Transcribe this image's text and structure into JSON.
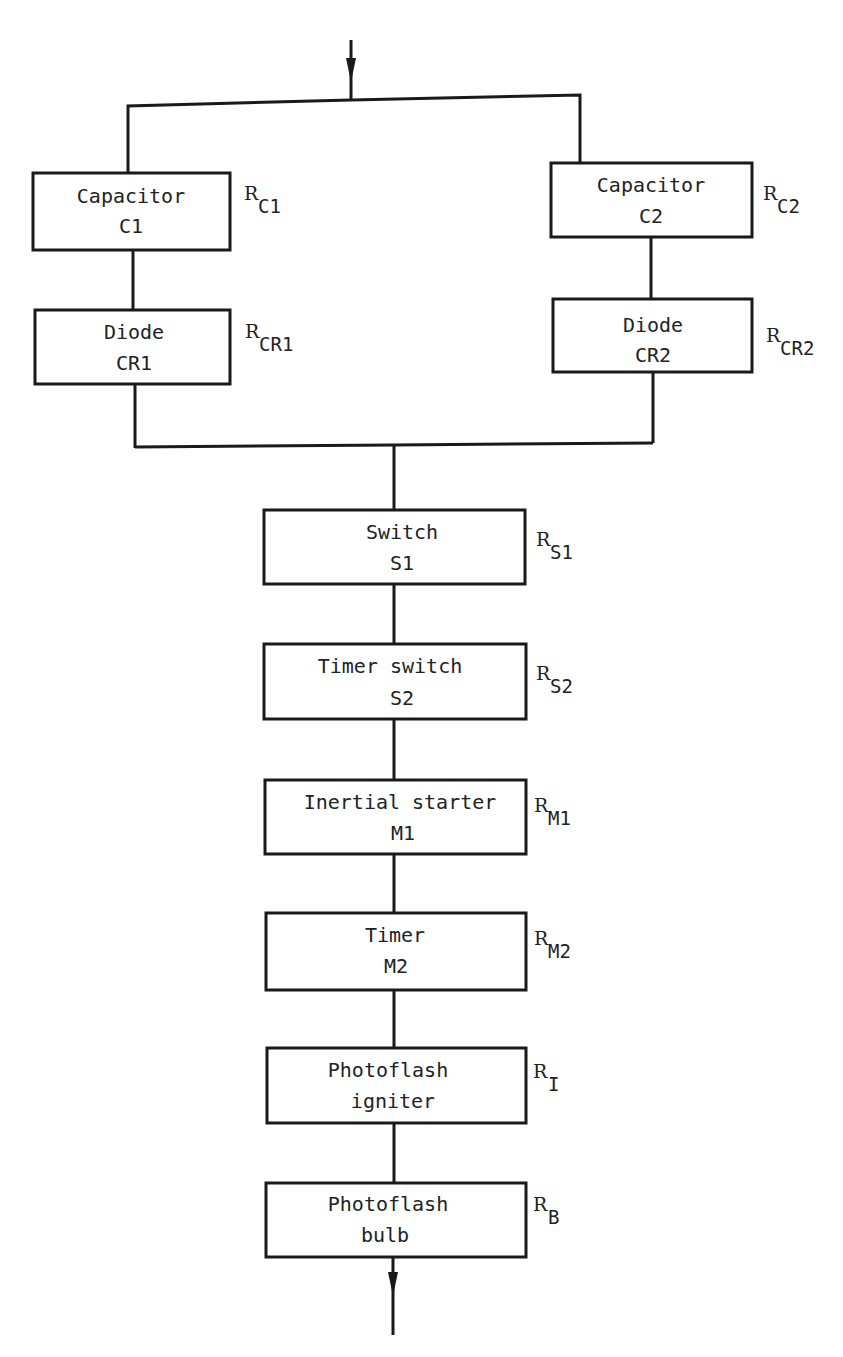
{
  "diagram": {
    "type": "reliability block diagram",
    "parallel_branches": [
      {
        "blocks": [
          {
            "line1": "Capacitor",
            "line2": "C1",
            "rel_base": "R",
            "rel_sub": "C1"
          },
          {
            "line1": "Diode",
            "line2": "CR1",
            "rel_base": "R",
            "rel_sub": "CR1"
          }
        ]
      },
      {
        "blocks": [
          {
            "line1": "Capacitor",
            "line2": "C2",
            "rel_base": "R",
            "rel_sub": "C2"
          },
          {
            "line1": "Diode",
            "line2": "CR2",
            "rel_base": "R",
            "rel_sub": "CR2"
          }
        ]
      }
    ],
    "series_blocks": [
      {
        "line1": "Switch",
        "line2": "S1",
        "rel_base": "R",
        "rel_sub": "S1"
      },
      {
        "line1": "Timer switch",
        "line2": "S2",
        "rel_base": "R",
        "rel_sub": "S2"
      },
      {
        "line1": "Inertial starter",
        "line2": "M1",
        "rel_base": "R",
        "rel_sub": "M1"
      },
      {
        "line1": "Timer",
        "line2": "M2",
        "rel_base": "R",
        "rel_sub": "M2"
      },
      {
        "line1": "Photoflash",
        "line2": "igniter",
        "rel_base": "R",
        "rel_sub": "I"
      },
      {
        "line1": "Photoflash",
        "line2": "bulb",
        "rel_base": "R",
        "rel_sub": "B"
      }
    ],
    "input_arrow": "arrow-down",
    "output_arrow": "arrow-down",
    "line_color": "#1a1a1a",
    "background": "#ffffff"
  }
}
